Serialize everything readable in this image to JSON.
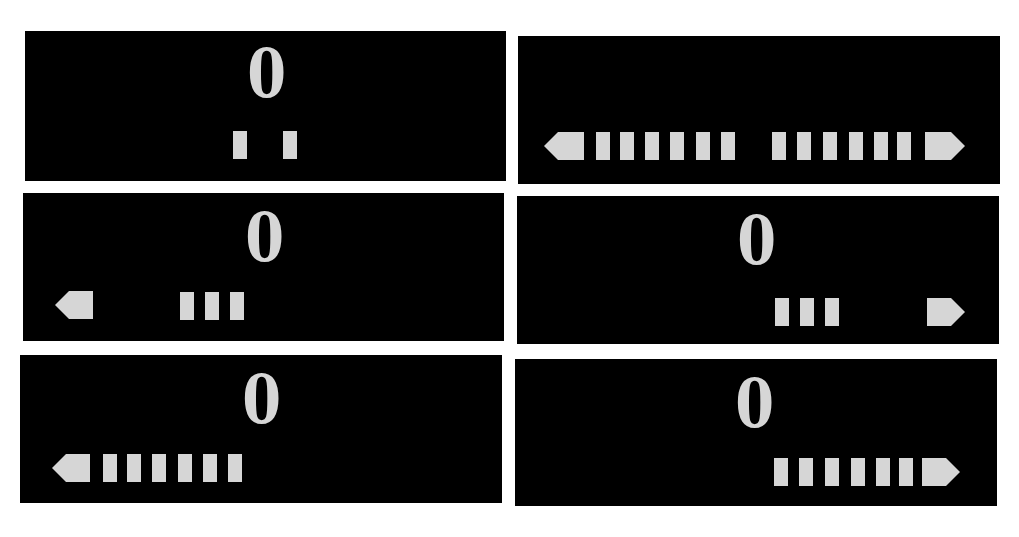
{
  "colors": {
    "background": "#ffffff",
    "panel": "#000000",
    "glyph": "#d6d6d6"
  },
  "panels": [
    {
      "position": "top-left",
      "digit": "0",
      "left_arrow": false,
      "right_arrow": false,
      "left_bars": 1,
      "right_bars": 1,
      "description": "Center indicator with one bar on each side"
    },
    {
      "position": "top-right",
      "digit": "",
      "left_arrow": true,
      "right_arrow": true,
      "left_bars": 6,
      "right_bars": 6,
      "description": "Full bidirectional indicator, no digit"
    },
    {
      "position": "middle-left",
      "digit": "0",
      "left_arrow": true,
      "right_arrow": false,
      "left_bars": 3,
      "right_bars": 0,
      "description": "Left arrow with three bars"
    },
    {
      "position": "middle-right",
      "digit": "0",
      "left_arrow": false,
      "right_arrow": true,
      "left_bars": 0,
      "right_bars": 3,
      "description": "Right arrow with three bars"
    },
    {
      "position": "bottom-left",
      "digit": "0",
      "left_arrow": true,
      "right_arrow": false,
      "left_bars": 6,
      "right_bars": 0,
      "description": "Left arrow with six bars"
    },
    {
      "position": "bottom-right",
      "digit": "0",
      "left_arrow": false,
      "right_arrow": true,
      "left_bars": 0,
      "right_bars": 6,
      "description": "Right arrow with six bars"
    }
  ]
}
